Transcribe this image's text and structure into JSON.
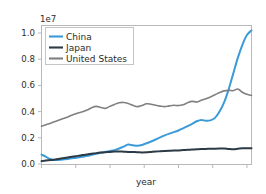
{
  "chart_data": {
    "type": "line",
    "title": "",
    "xlabel": "year",
    "ylabel": "",
    "y_offset_text": "1e7",
    "y_offset_multiplier": 10000000,
    "grid": false,
    "legend_position": "upper left",
    "xlim": [
      0,
      46
    ],
    "ylim": [
      0.0,
      1.08
    ],
    "yticks": [
      0.0,
      0.2,
      0.4,
      0.6,
      0.8,
      1.0
    ],
    "ytick_labels": [
      "0.0",
      "0.2",
      "0.4",
      "0.6",
      "0.8",
      "1.0"
    ],
    "xticks": [
      0,
      7.5,
      15,
      22.5,
      30,
      37.5,
      45
    ],
    "xtick_labels": [
      "",
      "",
      "",
      "",
      "",
      "",
      ""
    ],
    "x": [
      0,
      1,
      2,
      3,
      4,
      5,
      6,
      7,
      8,
      9,
      10,
      11,
      12,
      13,
      14,
      15,
      16,
      17,
      18,
      19,
      20,
      21,
      22,
      23,
      24,
      25,
      26,
      27,
      28,
      29,
      30,
      31,
      32,
      33,
      34,
      35,
      36,
      37,
      38,
      39,
      40,
      41,
      42,
      43,
      44,
      45,
      46
    ],
    "series": [
      {
        "name": "China",
        "color": "#3b9bd9",
        "linewidth": 2.0,
        "values": [
          0.072,
          0.055,
          0.036,
          0.03,
          0.032,
          0.036,
          0.04,
          0.045,
          0.05,
          0.056,
          0.062,
          0.07,
          0.078,
          0.086,
          0.093,
          0.099,
          0.106,
          0.118,
          0.133,
          0.148,
          0.143,
          0.139,
          0.145,
          0.158,
          0.172,
          0.187,
          0.203,
          0.219,
          0.232,
          0.243,
          0.256,
          0.272,
          0.289,
          0.307,
          0.326,
          0.336,
          0.33,
          0.333,
          0.352,
          0.4,
          0.47,
          0.57,
          0.69,
          0.81,
          0.91,
          0.985,
          1.02
        ]
      },
      {
        "name": "Japan",
        "color": "#2b3a45",
        "linewidth": 2.0,
        "values": [
          0.022,
          0.026,
          0.03,
          0.034,
          0.04,
          0.046,
          0.052,
          0.057,
          0.062,
          0.068,
          0.073,
          0.078,
          0.083,
          0.087,
          0.09,
          0.092,
          0.095,
          0.096,
          0.094,
          0.092,
          0.091,
          0.09,
          0.088,
          0.089,
          0.092,
          0.095,
          0.097,
          0.099,
          0.101,
          0.103,
          0.104,
          0.106,
          0.108,
          0.11,
          0.112,
          0.114,
          0.115,
          0.116,
          0.117,
          0.118,
          0.119,
          0.115,
          0.112,
          0.116,
          0.12,
          0.121,
          0.12
        ]
      },
      {
        "name": "United States",
        "color": "#808080",
        "linewidth": 1.6,
        "values": [
          0.288,
          0.3,
          0.312,
          0.325,
          0.338,
          0.35,
          0.363,
          0.378,
          0.39,
          0.398,
          0.412,
          0.43,
          0.44,
          0.432,
          0.425,
          0.44,
          0.455,
          0.468,
          0.47,
          0.462,
          0.448,
          0.438,
          0.446,
          0.46,
          0.456,
          0.448,
          0.442,
          0.438,
          0.444,
          0.448,
          0.446,
          0.452,
          0.468,
          0.478,
          0.474,
          0.486,
          0.498,
          0.512,
          0.528,
          0.545,
          0.558,
          0.562,
          0.56,
          0.572,
          0.548,
          0.532,
          0.524
        ]
      }
    ]
  },
  "legend": {
    "entries": [
      {
        "label": "China"
      },
      {
        "label": "Japan"
      },
      {
        "label": "United States"
      }
    ]
  },
  "axes": {
    "offset_text": "1e7",
    "x_axis_label": "year",
    "y_tick_0": "0.0",
    "y_tick_1": "0.2",
    "y_tick_2": "0.4",
    "y_tick_3": "0.6",
    "y_tick_4": "0.8",
    "y_tick_5": "1.0"
  }
}
